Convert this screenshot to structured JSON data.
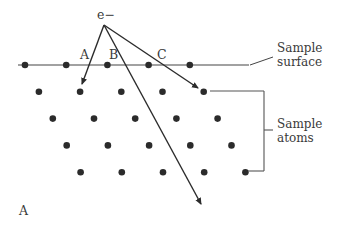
{
  "figure": {
    "panel_label": "A",
    "electron_label": "e−",
    "path_labels": [
      "A",
      "B",
      "C"
    ],
    "surface_label": [
      "Sample",
      "surface"
    ],
    "atoms_label": [
      "Sample",
      "atoms"
    ],
    "colors": {
      "ink": "#2b2b2b",
      "text": "#3a3a3a",
      "background": "#ffffff"
    },
    "lattice": {
      "rows": 5,
      "atoms_per_row": 5
    },
    "electron_paths": [
      {
        "name": "A",
        "description": "backscattered into second row"
      },
      {
        "name": "B",
        "description": "transmitted deep into sample"
      },
      {
        "name": "C",
        "description": "scattered to second-row atom"
      }
    ]
  }
}
